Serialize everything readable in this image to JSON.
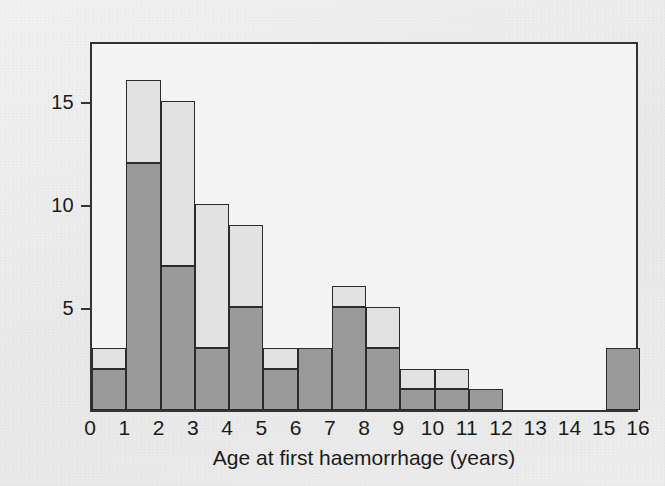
{
  "figure": {
    "background_color": "#ededed",
    "plot_background_color": "#f4f4f4",
    "frame_color": "#333333"
  },
  "chart_data": {
    "type": "bar",
    "subtype": "stacked-histogram",
    "title": "",
    "xlabel": "Age at first haemorrhage (years)",
    "ylabel": "Number of patients",
    "xlim": [
      0,
      16
    ],
    "ylim": [
      0,
      17.95
    ],
    "grid": false,
    "legend_position": "none",
    "x_tick_labels": [
      "0",
      "1",
      "2",
      "3",
      "4",
      "5",
      "6",
      "7",
      "8",
      "9",
      "10",
      "11",
      "12",
      "13",
      "14",
      "15",
      "16"
    ],
    "x_tick_values": [
      0,
      1,
      2,
      3,
      4,
      5,
      6,
      7,
      8,
      9,
      10,
      11,
      12,
      13,
      14,
      15,
      16
    ],
    "y_tick_labels": [
      "5",
      "10",
      "15"
    ],
    "y_tick_values": [
      5,
      10,
      15
    ],
    "bin_edges": [
      0,
      1,
      2,
      3,
      4,
      5,
      6,
      7,
      8,
      9,
      10,
      11,
      12,
      13,
      14,
      15,
      16
    ],
    "bin_labels": [
      "0-1",
      "1-2",
      "2-3",
      "3-4",
      "4-5",
      "5-6",
      "6-7",
      "7-8",
      "8-9",
      "9-10",
      "10-11",
      "11-12",
      "12-13",
      "13-14",
      "14-15",
      "15-16"
    ],
    "series": [
      {
        "name": "dark-segment",
        "color": "#9a9a9a",
        "values": [
          2,
          12,
          7,
          3,
          5,
          2,
          3,
          5,
          3,
          1,
          1,
          1,
          0,
          0,
          0,
          3
        ]
      },
      {
        "name": "light-segment",
        "color": "#e2e2e2",
        "values": [
          1,
          4,
          8,
          7,
          4,
          1,
          0,
          1,
          2,
          1,
          1,
          0,
          0,
          0,
          0,
          0
        ]
      }
    ],
    "totals": [
      3,
      16,
      15,
      10,
      9,
      3,
      3,
      6,
      5,
      2,
      2,
      1,
      0,
      0,
      0,
      3
    ]
  }
}
